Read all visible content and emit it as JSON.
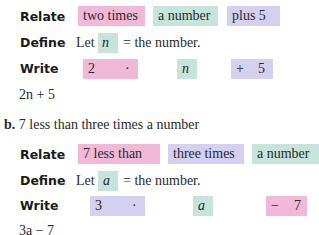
{
  "part_a": {
    "relate": {
      "label": "Relate",
      "phrases": [
        "two  times",
        "a number",
        "plus  5"
      ]
    },
    "define": {
      "label": "Define",
      "prefix": "Let",
      "variable": "n",
      "suffix": "=  the number."
    },
    "write": {
      "label": "Write",
      "terms": [
        "2",
        "·",
        "n",
        "+",
        "5"
      ]
    },
    "result": "2n + 5"
  },
  "part_b": {
    "marker": "b.",
    "prompt": "7 less than three times a number",
    "relate": {
      "label": "Relate",
      "phrases": [
        "7    less than",
        "three times",
        "a number"
      ]
    },
    "define": {
      "label": "Define",
      "prefix": "Let",
      "variable": "a",
      "suffix": "=  the number."
    },
    "write": {
      "label": "Write",
      "terms": [
        "3",
        "·",
        "a",
        "−",
        "7"
      ]
    },
    "result": "3a − 7"
  },
  "colors": {
    "pink": "#f2b8d8",
    "green": "#c7e4dc",
    "purple": "#d3d0f0"
  }
}
